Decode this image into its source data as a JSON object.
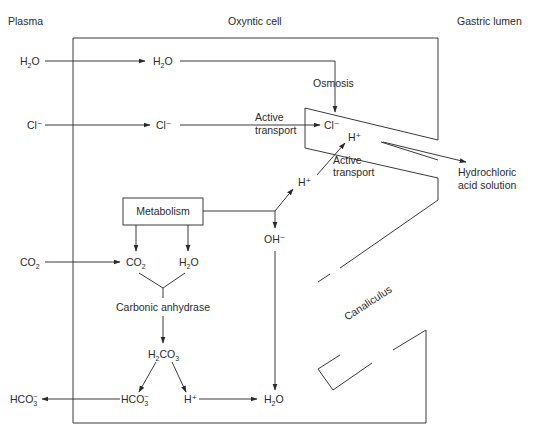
{
  "headers": {
    "plasma": "Plasma",
    "cell": "Oxyntic cell",
    "lumen": "Gastric lumen"
  },
  "plasma": {
    "water": "H₂O",
    "chloride": "Cl⁻",
    "co2": "CO₂",
    "bicarbonate": "HCO₃⁻"
  },
  "cell": {
    "water": "H₂O",
    "chloride": "Cl⁻",
    "metabolism": "Metabolism",
    "co2": "CO₂",
    "metabolic_water": "H₂O",
    "carbonic_anhydrase": "Carbonic anhydrase",
    "carbonic_acid": "H₂CO₃",
    "bicarbonate": "HCO₃⁻",
    "proton": "H⁺",
    "product_water": "H₂O",
    "hydroxide": "OH⁻",
    "proton_upper": "H⁺"
  },
  "canaliculus": {
    "label": "Canaliculus",
    "chloride": "Cl⁻",
    "proton": "H⁺"
  },
  "processes": {
    "osmosis": "Osmosis",
    "active_transport_cl_line1": "Active",
    "active_transport_cl_line2": "transport",
    "active_transport_h_line1": "Active",
    "active_transport_h_line2": "transport"
  },
  "lumen": {
    "output_line1": "Hydrochloric",
    "output_line2": "acid solution"
  }
}
